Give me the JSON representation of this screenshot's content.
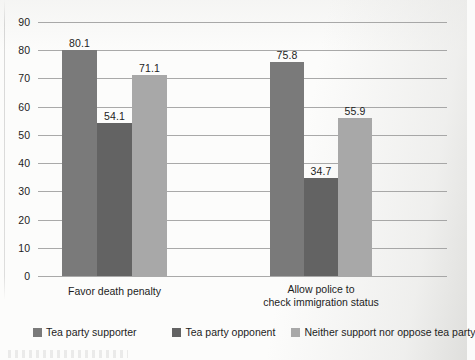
{
  "chart_data": {
    "type": "bar",
    "title": "",
    "xlabel": "",
    "ylabel": "",
    "ylim": [
      0,
      90
    ],
    "ytick_step": 10,
    "yticks": [
      90,
      80,
      70,
      60,
      50,
      40,
      30,
      20,
      10,
      0
    ],
    "grid": true,
    "legend_position": "bottom",
    "categories": [
      "Favor death penalty",
      "Allow police to\ncheck immigration status"
    ],
    "series": [
      {
        "name": "Tea party supporter",
        "color": "#7a7a7a",
        "values": [
          80.1,
          75.8
        ],
        "labels": [
          "80.1",
          "75.8"
        ]
      },
      {
        "name": "Tea party opponent",
        "color": "#636363",
        "values": [
          54.1,
          34.7
        ],
        "labels": [
          "54.1",
          "34.7"
        ]
      },
      {
        "name": "Neither support nor oppose tea party",
        "color": "#a8a8a8",
        "values": [
          71.1,
          55.9
        ],
        "labels": [
          "71.1",
          "55.9"
        ]
      }
    ]
  },
  "axis": {
    "y_tick_labels": [
      "90",
      "80",
      "70",
      "60",
      "50",
      "40",
      "30",
      "20",
      "10",
      "0"
    ]
  },
  "categories": [
    {
      "label": "Favor death penalty"
    },
    {
      "label": "Allow police to\ncheck immigration status"
    }
  ],
  "legend": {
    "items": [
      {
        "label": "Tea party supporter",
        "color": "#7a7a7a"
      },
      {
        "label": "Tea party opponent",
        "color": "#636363"
      },
      {
        "label": "Neither support nor oppose tea party",
        "color": "#a8a8a8"
      }
    ]
  }
}
